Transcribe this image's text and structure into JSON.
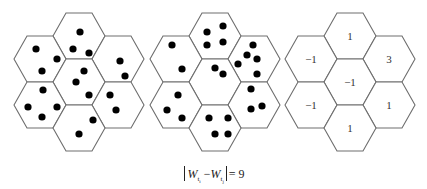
{
  "figure": {
    "type": "hexagonal cell grid comparison",
    "hex_layout": {
      "orientation": "flat-top",
      "cells": [
        "top",
        "upper-left",
        "upper-right",
        "center",
        "lower-left",
        "lower-right",
        "bottom"
      ]
    },
    "panels": [
      {
        "id": "panel-1",
        "center_x": 79,
        "dot_counts": {
          "top": 3,
          "upper-left": 3,
          "upper-right": 2,
          "center": 3,
          "lower-left": 4,
          "lower-right": 2,
          "bottom": 2
        },
        "dots": [
          [
            80,
            32
          ],
          [
            73,
            49
          ],
          [
            89,
            53
          ],
          [
            36,
            49
          ],
          [
            57,
            59
          ],
          [
            42,
            71
          ],
          [
            120,
            61
          ],
          [
            125,
            76
          ],
          [
            84,
            71
          ],
          [
            76,
            82
          ],
          [
            89,
            95
          ],
          [
            43,
            90
          ],
          [
            28,
            107
          ],
          [
            57,
            107
          ],
          [
            42,
            117
          ],
          [
            110,
            95
          ],
          [
            116,
            110
          ],
          [
            93,
            120
          ],
          [
            79,
            134
          ]
        ]
      },
      {
        "id": "panel-2",
        "center_x": 215,
        "dot_counts": {
          "top": 4,
          "upper-left": 2,
          "upper-right": 5,
          "center": 2,
          "lower-left": 3,
          "lower-right": 3,
          "bottom": 4
        },
        "dots": [
          [
            207,
            32
          ],
          [
            223,
            26
          ],
          [
            207,
            45
          ],
          [
            223,
            42
          ],
          [
            172,
            45
          ],
          [
            182,
            69
          ],
          [
            253,
            45
          ],
          [
            247,
            55
          ],
          [
            257,
            59
          ],
          [
            238,
            64
          ],
          [
            257,
            74
          ],
          [
            215,
            68
          ],
          [
            223,
            74
          ],
          [
            178,
            95
          ],
          [
            167,
            110
          ],
          [
            182,
            118
          ],
          [
            251,
            89
          ],
          [
            251,
            109
          ],
          [
            262,
            106
          ],
          [
            209,
            118
          ],
          [
            228,
            118
          ],
          [
            215,
            134
          ],
          [
            228,
            134
          ]
        ]
      },
      {
        "id": "panel-3",
        "center_x": 350,
        "cell_values": {
          "top": "1",
          "upper-left": "−1",
          "upper-right": "3",
          "center": "−1",
          "lower-left": "−1",
          "lower-right": "1",
          "bottom": "1"
        }
      }
    ],
    "formula": {
      "text": "|W_{t_i} − W_{t_j}| = 9",
      "left_var": "W",
      "left_sub": "t",
      "left_subsub": "i",
      "minus": "−",
      "right_var": "W",
      "right_sub": "t",
      "right_subsub": "j",
      "equals": "= 9"
    }
  }
}
